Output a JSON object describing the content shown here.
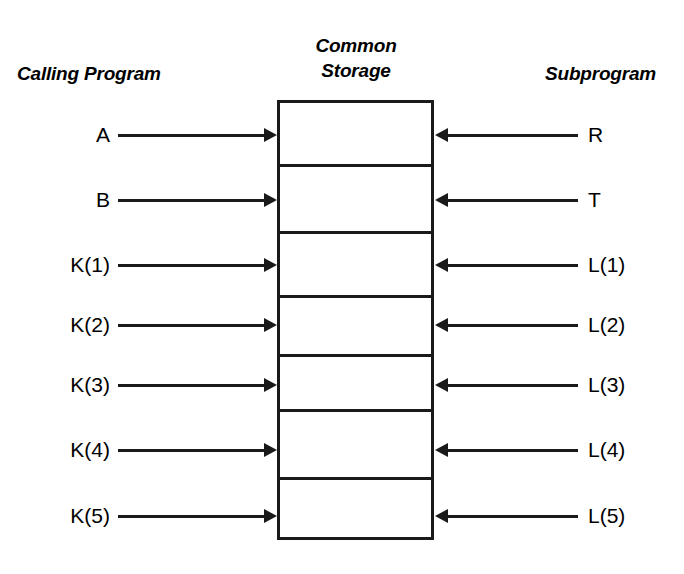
{
  "diagram": {
    "title_common_storage": "Common\nStorage",
    "headers": {
      "left": "Calling Program",
      "center_line1": "Common",
      "center_line2": "Storage",
      "right": "Subprogram"
    },
    "ink_color": "#1a1a1a",
    "background_color": "#ffffff",
    "storage_block": {
      "cell_count": 7,
      "border_color": "#1a1a1a"
    },
    "rows": [
      {
        "left_label": "A",
        "right_label": "R",
        "left_arrow": "arrow-right",
        "right_arrow": "arrow-left"
      },
      {
        "left_label": "B",
        "right_label": "T",
        "left_arrow": "arrow-right",
        "right_arrow": "arrow-left"
      },
      {
        "left_label": "K(1)",
        "right_label": "L(1)",
        "left_arrow": "arrow-right",
        "right_arrow": "arrow-left"
      },
      {
        "left_label": "K(2)",
        "right_label": "L(2)",
        "left_arrow": "arrow-right",
        "right_arrow": "arrow-left"
      },
      {
        "left_label": "K(3)",
        "right_label": "L(3)",
        "left_arrow": "arrow-right",
        "right_arrow": "arrow-left"
      },
      {
        "left_label": "K(4)",
        "right_label": "L(4)",
        "left_arrow": "arrow-right",
        "right_arrow": "arrow-left"
      },
      {
        "left_label": "K(5)",
        "right_label": "L(5)",
        "left_arrow": "arrow-right",
        "right_arrow": "arrow-left"
      }
    ]
  },
  "geometry": {
    "row_y": [
      135,
      200,
      265,
      325,
      385,
      450,
      516
    ],
    "divider_y": [
      165,
      232,
      296,
      355,
      410,
      478
    ],
    "box_left": 277,
    "box_right": 434,
    "box_top": 100,
    "box_bottom": 540,
    "left_line_start": 118,
    "right_line_end": 578
  }
}
